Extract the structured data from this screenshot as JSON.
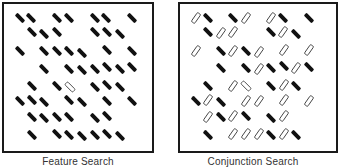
{
  "figure": {
    "panels": [
      {
        "name": "feature-search",
        "caption": "Feature Search",
        "items": [
          {
            "x": 20,
            "y": 18,
            "c": "black",
            "o": "back"
          },
          {
            "x": 31,
            "y": 18,
            "c": "black",
            "o": "back"
          },
          {
            "x": 57,
            "y": 18,
            "c": "black",
            "o": "back"
          },
          {
            "x": 69,
            "y": 18,
            "c": "black",
            "o": "back"
          },
          {
            "x": 95,
            "y": 18,
            "c": "black",
            "o": "back"
          },
          {
            "x": 106,
            "y": 18,
            "c": "black",
            "o": "back"
          },
          {
            "x": 132,
            "y": 18,
            "c": "black",
            "o": "back"
          },
          {
            "x": 32,
            "y": 32,
            "c": "black",
            "o": "back"
          },
          {
            "x": 44,
            "y": 34,
            "c": "black",
            "o": "back"
          },
          {
            "x": 57,
            "y": 32,
            "c": "black",
            "o": "back"
          },
          {
            "x": 95,
            "y": 32,
            "c": "black",
            "o": "back"
          },
          {
            "x": 107,
            "y": 32,
            "c": "black",
            "o": "back"
          },
          {
            "x": 120,
            "y": 34,
            "c": "black",
            "o": "back"
          },
          {
            "x": 20,
            "y": 51,
            "c": "black",
            "o": "back"
          },
          {
            "x": 44,
            "y": 51,
            "c": "black",
            "o": "back"
          },
          {
            "x": 57,
            "y": 51,
            "c": "black",
            "o": "back"
          },
          {
            "x": 69,
            "y": 51,
            "c": "black",
            "o": "back"
          },
          {
            "x": 82,
            "y": 53,
            "c": "black",
            "o": "back"
          },
          {
            "x": 107,
            "y": 50,
            "c": "black",
            "o": "back"
          },
          {
            "x": 132,
            "y": 51,
            "c": "black",
            "o": "back"
          },
          {
            "x": 44,
            "y": 69,
            "c": "black",
            "o": "back"
          },
          {
            "x": 69,
            "y": 69,
            "c": "black",
            "o": "back"
          },
          {
            "x": 82,
            "y": 70,
            "c": "black",
            "o": "back"
          },
          {
            "x": 95,
            "y": 69,
            "c": "black",
            "o": "back"
          },
          {
            "x": 107,
            "y": 67,
            "c": "black",
            "o": "back"
          },
          {
            "x": 120,
            "y": 69,
            "c": "black",
            "o": "back"
          },
          {
            "x": 132,
            "y": 67,
            "c": "black",
            "o": "back"
          },
          {
            "x": 32,
            "y": 86,
            "c": "black",
            "o": "back"
          },
          {
            "x": 57,
            "y": 86,
            "c": "black",
            "o": "back"
          },
          {
            "x": 70,
            "y": 87,
            "c": "white",
            "o": "back",
            "target": true
          },
          {
            "x": 95,
            "y": 87,
            "c": "black",
            "o": "back"
          },
          {
            "x": 107,
            "y": 85,
            "c": "black",
            "o": "back"
          },
          {
            "x": 120,
            "y": 87,
            "c": "black",
            "o": "back"
          },
          {
            "x": 20,
            "y": 101,
            "c": "black",
            "o": "back"
          },
          {
            "x": 32,
            "y": 100,
            "c": "black",
            "o": "back"
          },
          {
            "x": 44,
            "y": 102,
            "c": "black",
            "o": "back"
          },
          {
            "x": 69,
            "y": 100,
            "c": "black",
            "o": "back"
          },
          {
            "x": 82,
            "y": 102,
            "c": "black",
            "o": "back"
          },
          {
            "x": 107,
            "y": 101,
            "c": "black",
            "o": "back"
          },
          {
            "x": 132,
            "y": 101,
            "c": "black",
            "o": "back"
          },
          {
            "x": 32,
            "y": 117,
            "c": "black",
            "o": "back"
          },
          {
            "x": 44,
            "y": 118,
            "c": "black",
            "o": "back"
          },
          {
            "x": 57,
            "y": 117,
            "c": "black",
            "o": "back"
          },
          {
            "x": 69,
            "y": 117,
            "c": "black",
            "o": "back"
          },
          {
            "x": 95,
            "y": 118,
            "c": "black",
            "o": "back"
          },
          {
            "x": 107,
            "y": 116,
            "c": "black",
            "o": "back"
          },
          {
            "x": 32,
            "y": 135,
            "c": "black",
            "o": "back"
          },
          {
            "x": 57,
            "y": 134,
            "c": "black",
            "o": "back"
          },
          {
            "x": 69,
            "y": 135,
            "c": "black",
            "o": "back"
          },
          {
            "x": 82,
            "y": 136,
            "c": "black",
            "o": "back"
          },
          {
            "x": 95,
            "y": 135,
            "c": "black",
            "o": "back"
          },
          {
            "x": 107,
            "y": 134,
            "c": "black",
            "o": "back"
          },
          {
            "x": 120,
            "y": 136,
            "c": "black",
            "o": "back"
          }
        ]
      },
      {
        "name": "conjunction-search",
        "caption": "Conjunction Search",
        "items": [
          {
            "x": 196,
            "y": 18,
            "c": "white",
            "o": "fwd"
          },
          {
            "x": 208,
            "y": 18,
            "c": "black",
            "o": "back"
          },
          {
            "x": 233,
            "y": 18,
            "c": "black",
            "o": "back"
          },
          {
            "x": 246,
            "y": 18,
            "c": "white",
            "o": "fwd"
          },
          {
            "x": 271,
            "y": 18,
            "c": "white",
            "o": "fwd"
          },
          {
            "x": 283,
            "y": 18,
            "c": "black",
            "o": "back"
          },
          {
            "x": 309,
            "y": 18,
            "c": "black",
            "o": "back"
          },
          {
            "x": 208,
            "y": 32,
            "c": "black",
            "o": "back"
          },
          {
            "x": 221,
            "y": 33,
            "c": "white",
            "o": "fwd"
          },
          {
            "x": 233,
            "y": 32,
            "c": "white",
            "o": "fwd"
          },
          {
            "x": 271,
            "y": 32,
            "c": "black",
            "o": "back"
          },
          {
            "x": 283,
            "y": 32,
            "c": "white",
            "o": "fwd"
          },
          {
            "x": 296,
            "y": 34,
            "c": "black",
            "o": "back"
          },
          {
            "x": 196,
            "y": 51,
            "c": "white",
            "o": "fwd"
          },
          {
            "x": 221,
            "y": 51,
            "c": "black",
            "o": "back"
          },
          {
            "x": 233,
            "y": 51,
            "c": "white",
            "o": "fwd"
          },
          {
            "x": 246,
            "y": 51,
            "c": "black",
            "o": "back"
          },
          {
            "x": 259,
            "y": 52,
            "c": "white",
            "o": "fwd"
          },
          {
            "x": 284,
            "y": 50,
            "c": "white",
            "o": "fwd"
          },
          {
            "x": 309,
            "y": 50,
            "c": "white",
            "o": "fwd"
          },
          {
            "x": 221,
            "y": 68,
            "c": "black",
            "o": "back"
          },
          {
            "x": 246,
            "y": 68,
            "c": "black",
            "o": "back"
          },
          {
            "x": 259,
            "y": 69,
            "c": "white",
            "o": "fwd"
          },
          {
            "x": 271,
            "y": 68,
            "c": "black",
            "o": "back"
          },
          {
            "x": 284,
            "y": 66,
            "c": "black",
            "o": "back"
          },
          {
            "x": 296,
            "y": 68,
            "c": "white",
            "o": "fwd"
          },
          {
            "x": 309,
            "y": 67,
            "c": "black",
            "o": "back"
          },
          {
            "x": 208,
            "y": 86,
            "c": "black",
            "o": "back"
          },
          {
            "x": 233,
            "y": 86,
            "c": "white",
            "o": "fwd"
          },
          {
            "x": 246,
            "y": 86,
            "c": "white",
            "o": "back",
            "target": true
          },
          {
            "x": 271,
            "y": 86,
            "c": "black",
            "o": "back"
          },
          {
            "x": 284,
            "y": 85,
            "c": "white",
            "o": "fwd"
          },
          {
            "x": 296,
            "y": 86,
            "c": "black",
            "o": "back"
          },
          {
            "x": 196,
            "y": 101,
            "c": "black",
            "o": "back"
          },
          {
            "x": 208,
            "y": 100,
            "c": "white",
            "o": "fwd"
          },
          {
            "x": 221,
            "y": 102,
            "c": "black",
            "o": "back"
          },
          {
            "x": 246,
            "y": 101,
            "c": "white",
            "o": "fwd"
          },
          {
            "x": 259,
            "y": 101,
            "c": "white",
            "o": "fwd"
          },
          {
            "x": 284,
            "y": 100,
            "c": "white",
            "o": "fwd"
          },
          {
            "x": 309,
            "y": 101,
            "c": "white",
            "o": "fwd"
          },
          {
            "x": 208,
            "y": 117,
            "c": "white",
            "o": "fwd"
          },
          {
            "x": 221,
            "y": 117,
            "c": "black",
            "o": "back"
          },
          {
            "x": 233,
            "y": 116,
            "c": "white",
            "o": "fwd"
          },
          {
            "x": 246,
            "y": 116,
            "c": "black",
            "o": "back"
          },
          {
            "x": 271,
            "y": 118,
            "c": "black",
            "o": "back"
          },
          {
            "x": 284,
            "y": 116,
            "c": "white",
            "o": "fwd"
          },
          {
            "x": 208,
            "y": 135,
            "c": "black",
            "o": "back"
          },
          {
            "x": 233,
            "y": 134,
            "c": "white",
            "o": "fwd"
          },
          {
            "x": 246,
            "y": 134,
            "c": "white",
            "o": "fwd"
          },
          {
            "x": 259,
            "y": 134,
            "c": "white",
            "o": "fwd"
          },
          {
            "x": 271,
            "y": 135,
            "c": "black",
            "o": "back"
          },
          {
            "x": 284,
            "y": 134,
            "c": "white",
            "o": "fwd"
          },
          {
            "x": 296,
            "y": 135,
            "c": "black",
            "o": "back"
          }
        ]
      }
    ],
    "colors": {
      "frame": "#1a1a1a",
      "bar_black": "#111111",
      "bar_white_fill": "#ffffff",
      "bar_white_stroke": "#444444",
      "caption": "#333333"
    }
  }
}
